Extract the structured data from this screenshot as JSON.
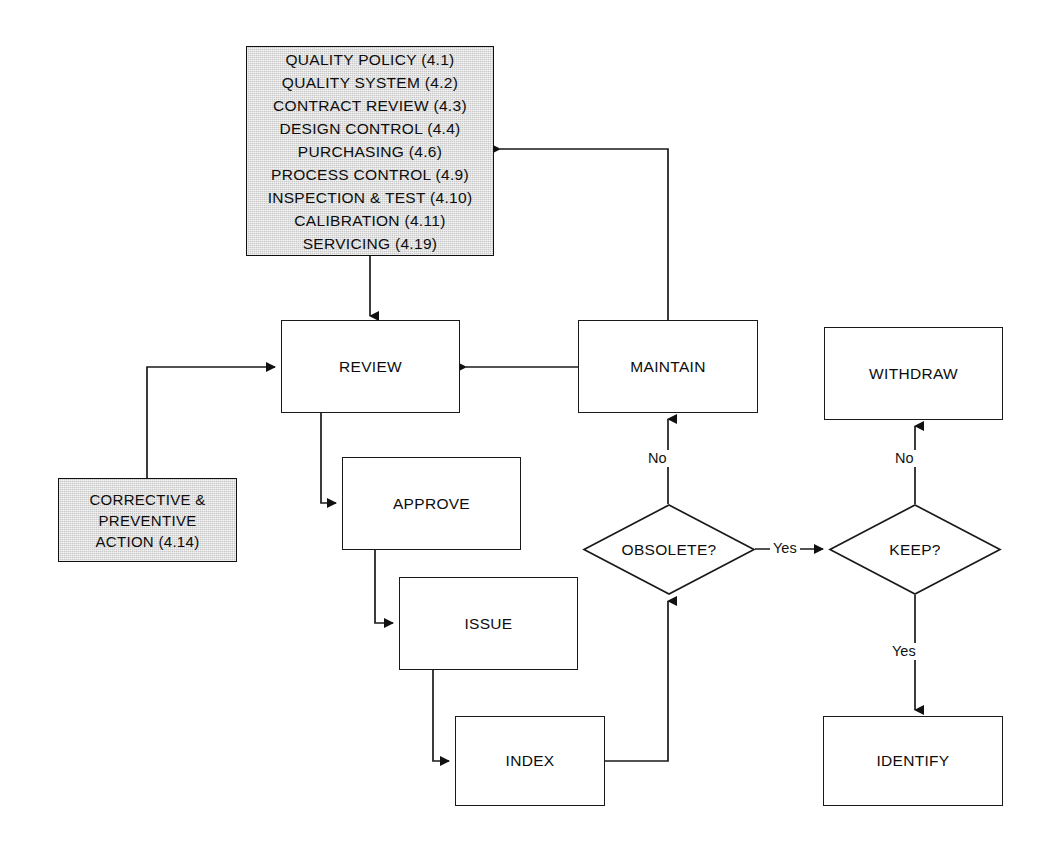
{
  "diagram": {
    "colors": {
      "shaded_fill": "#c9c9c9",
      "line": "#1a1a1a",
      "text": "#0d0d0d",
      "background": "#ffffff"
    },
    "nodes": {
      "standards": {
        "label": "QUALITY POLICY (4.1)\nQUALITY SYSTEM (4.2)\nCONTRACT REVIEW (4.3)\nDESIGN CONTROL (4.4)\nPURCHASING (4.6)\nPROCESS CONTROL (4.9)\nINSPECTION & TEST (4.10)\nCALIBRATION (4.11)\nSERVICING (4.19)",
        "shape": "process-shaded",
        "items": [
          "QUALITY POLICY (4.1)",
          "QUALITY SYSTEM (4.2)",
          "CONTRACT REVIEW (4.3)",
          "DESIGN CONTROL (4.4)",
          "PURCHASING (4.6)",
          "PROCESS CONTROL (4.9)",
          "INSPECTION & TEST (4.10)",
          "CALIBRATION (4.11)",
          "SERVICING (4.19)"
        ]
      },
      "corrective": {
        "label": "CORRECTIVE &\nPREVENTIVE\nACTION (4.14)",
        "shape": "process-shaded"
      },
      "review": {
        "label": "REVIEW",
        "shape": "process"
      },
      "maintain": {
        "label": "MAINTAIN",
        "shape": "process"
      },
      "withdraw": {
        "label": "WITHDRAW",
        "shape": "process"
      },
      "approve": {
        "label": "APPROVE",
        "shape": "process"
      },
      "issue": {
        "label": "ISSUE",
        "shape": "process"
      },
      "index": {
        "label": "INDEX",
        "shape": "process"
      },
      "identify": {
        "label": "IDENTIFY",
        "shape": "process"
      },
      "obsolete": {
        "label": "OBSOLETE?",
        "shape": "decision"
      },
      "keep": {
        "label": "KEEP?",
        "shape": "decision"
      }
    },
    "edge_labels": {
      "obsolete_no": "No",
      "obsolete_yes": "Yes",
      "keep_no": "No",
      "keep_yes": "Yes"
    }
  }
}
